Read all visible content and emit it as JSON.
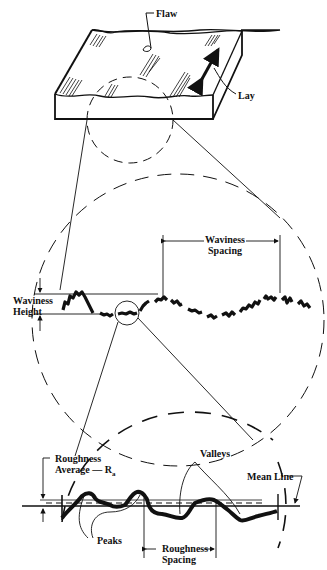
{
  "diagram": {
    "type": "surface-texture-illustration",
    "colors": {
      "ink": "#111111",
      "background": "#ffffff"
    },
    "block": {
      "labels": {
        "flaw": "Flaw",
        "lay": "Lay"
      }
    },
    "waviness_view": {
      "labels": {
        "spacing_line1": "Waviness",
        "spacing_line2": "Spacing",
        "height_line1": "Waviness",
        "height_line2": "Height"
      }
    },
    "roughness_view": {
      "labels": {
        "ra_line1": "Roughness",
        "ra_line2": "Average — R",
        "ra_subscript": "a",
        "valleys": "Valleys",
        "mean_line": "Mean Line",
        "peaks": "Peaks",
        "spacing_line1": "Roughness",
        "spacing_line2": "Spacing"
      }
    }
  }
}
